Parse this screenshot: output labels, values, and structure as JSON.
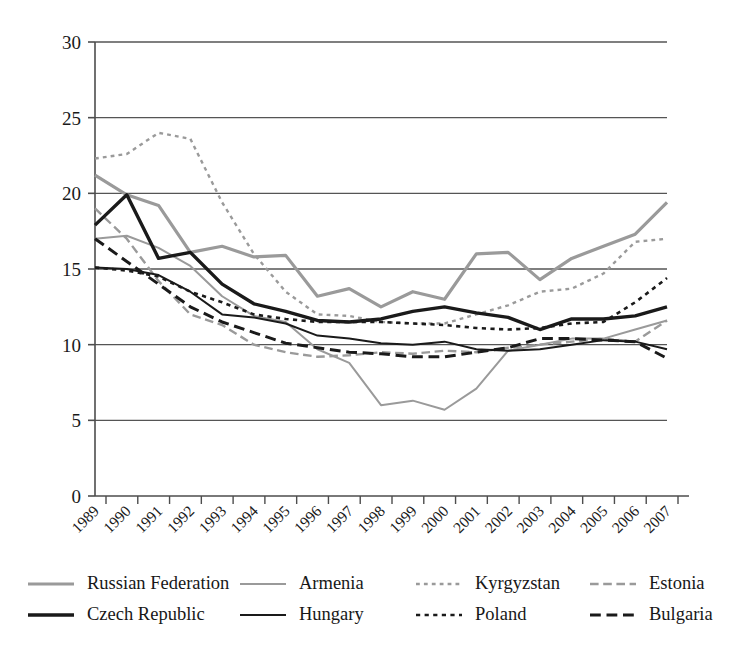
{
  "chart_data": {
    "type": "line",
    "title": "",
    "subtitle": "",
    "xlabel": "",
    "ylabel": "",
    "xlim": [
      1989,
      2007
    ],
    "ylim": [
      0,
      30
    ],
    "yticks": [
      0,
      5,
      10,
      15,
      20,
      25,
      30
    ],
    "ytick_labels": [
      "0",
      "5",
      "10",
      "15",
      "20",
      "25",
      "30"
    ],
    "grid": true,
    "grid_axis": "y",
    "legend_position": "bottom",
    "legend_columns": 4,
    "categories": [
      "1989",
      "1990",
      "1991",
      "1992",
      "1993",
      "1994",
      "1995",
      "1996",
      "1997",
      "1998",
      "1999",
      "2000",
      "2001",
      "2002",
      "2003",
      "2004",
      "2005",
      "2006",
      "2007"
    ],
    "x": [
      1989,
      1990,
      1991,
      1992,
      1993,
      1994,
      1995,
      1996,
      1997,
      1998,
      1999,
      2000,
      2001,
      2002,
      2003,
      2004,
      2005,
      2006,
      2007
    ],
    "series": [
      {
        "name": "Russian Federation",
        "color": "#9a9a9a",
        "style": "solid",
        "width": 3.2,
        "values": [
          21.2,
          19.9,
          19.2,
          16.1,
          16.5,
          15.8,
          15.9,
          13.2,
          13.7,
          12.5,
          13.5,
          13.0,
          16.0,
          16.1,
          14.3,
          15.7,
          16.5,
          17.3,
          19.4
        ]
      },
      {
        "name": "Armenia",
        "color": "#9a9a9a",
        "style": "solid",
        "width": 2.0,
        "values": [
          17.0,
          17.2,
          16.4,
          15.2,
          13.2,
          11.9,
          11.5,
          9.7,
          8.8,
          6.0,
          6.3,
          5.7,
          7.1,
          9.6,
          10.0,
          10.4,
          10.4,
          11.0,
          11.6
        ]
      },
      {
        "name": "Kyrgyzstan",
        "color": "#9a9a9a",
        "style": "dotted",
        "width": 2.4,
        "values": [
          22.3,
          22.6,
          24.0,
          23.6,
          19.4,
          16.0,
          13.5,
          12.0,
          11.9,
          11.5,
          11.4,
          11.4,
          12.0,
          12.6,
          13.5,
          13.7,
          14.7,
          16.8,
          17.0
        ]
      },
      {
        "name": "Estonia",
        "color": "#9a9a9a",
        "style": "dashed",
        "width": 2.4,
        "values": [
          19.0,
          17.0,
          14.2,
          12.0,
          11.3,
          10.0,
          9.5,
          9.2,
          9.3,
          9.5,
          9.4,
          9.6,
          9.5,
          9.8,
          10.0,
          10.2,
          10.4,
          10.2,
          11.6
        ]
      },
      {
        "name": "Czech Republic",
        "color": "#1a1a1a",
        "style": "solid",
        "width": 3.4,
        "values": [
          17.9,
          19.9,
          15.7,
          16.1,
          14.0,
          12.7,
          12.2,
          11.6,
          11.5,
          11.7,
          12.2,
          12.5,
          12.1,
          11.8,
          11.0,
          11.7,
          11.7,
          11.9,
          12.5
        ]
      },
      {
        "name": "Hungary",
        "color": "#1a1a1a",
        "style": "solid",
        "width": 2.0,
        "values": [
          15.1,
          15.0,
          14.6,
          13.5,
          12.0,
          11.8,
          11.4,
          10.6,
          10.4,
          10.1,
          10.0,
          10.2,
          9.7,
          9.6,
          9.7,
          10.0,
          10.3,
          10.2,
          9.7
        ]
      },
      {
        "name": "Poland",
        "color": "#1a1a1a",
        "style": "dotted",
        "width": 2.6,
        "values": [
          15.1,
          14.9,
          14.5,
          13.5,
          12.8,
          12.0,
          11.7,
          11.5,
          11.5,
          11.5,
          11.4,
          11.3,
          11.1,
          11.0,
          11.1,
          11.4,
          11.5,
          12.8,
          14.4
        ]
      },
      {
        "name": "Bulgaria",
        "color": "#1a1a1a",
        "style": "dashed",
        "width": 3.0,
        "values": [
          17.0,
          15.5,
          14.0,
          12.5,
          11.5,
          10.8,
          10.1,
          9.8,
          9.5,
          9.4,
          9.2,
          9.2,
          9.5,
          9.8,
          10.4,
          10.4,
          10.3,
          10.2,
          9.1
        ]
      }
    ]
  },
  "legend": {
    "rows": [
      [
        {
          "label": "Russian Federation",
          "series": 0
        },
        {
          "label": "Armenia",
          "series": 1
        },
        {
          "label": "Kyrgyzstan",
          "series": 2
        },
        {
          "label": "Estonia",
          "series": 3
        }
      ],
      [
        {
          "label": "Czech Republic",
          "series": 4
        },
        {
          "label": "Hungary",
          "series": 5
        },
        {
          "label": "Poland",
          "series": 6
        },
        {
          "label": "Bulgaria",
          "series": 7
        }
      ]
    ]
  },
  "colors": {
    "axis": "#4d4d4d",
    "grid": "#555555",
    "gray_series": "#9a9a9a",
    "black_series": "#1a1a1a",
    "background": "#ffffff"
  }
}
